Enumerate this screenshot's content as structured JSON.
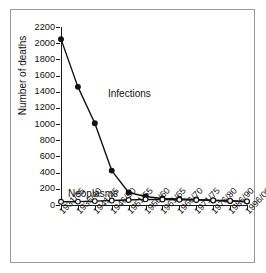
{
  "chart_data": {
    "type": "line",
    "title": "",
    "xlabel": "",
    "ylabel": "Number of deaths",
    "ylim": [
      0,
      2200
    ],
    "ytick_step": 200,
    "grid": false,
    "legend_position": "inline-annotation",
    "categories": [
      "1931/35",
      "1936/40",
      "1941/45",
      "1946/50",
      "1951/55",
      "1956/60",
      "1961/65",
      "1966/70",
      "1971/75",
      "1976/80",
      "1986/90",
      "1996/00"
    ],
    "ytick_labels": [
      "2200",
      "2000",
      "1800",
      "1600",
      "1400",
      "1200",
      "1000",
      "800",
      "600",
      "400",
      "200",
      "0"
    ],
    "series": [
      {
        "name": "Infections",
        "marker": "filled-circle",
        "color": "#111111",
        "values": [
          2050,
          1460,
          1010,
          425,
          155,
          105,
          80,
          75,
          70,
          55,
          48,
          42
        ]
      },
      {
        "name": "Neoplasms",
        "marker": "open-circle",
        "color": "#111111",
        "values": [
          40,
          42,
          48,
          55,
          62,
          70,
          68,
          65,
          62,
          58,
          52,
          45
        ]
      }
    ],
    "annotations": [
      {
        "text": "Infections",
        "x_fraction": 0.25,
        "y_value": 1290
      },
      {
        "text": "Neoplasms",
        "x_fraction": 0.04,
        "y_value": 215
      }
    ]
  },
  "figure": {
    "background_color": "#ffffff",
    "frame_color": "#9a9a9a",
    "axis_color": "#1a1a1a"
  }
}
